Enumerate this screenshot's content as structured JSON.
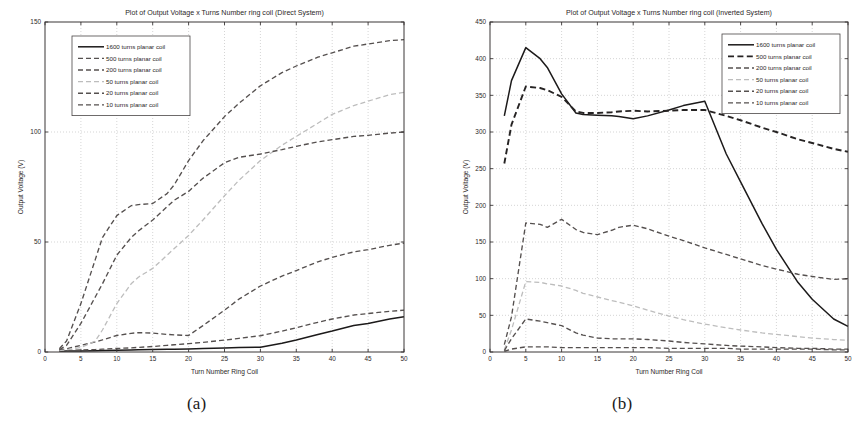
{
  "figure": {
    "caption_a": "(a)",
    "caption_b": "(b)"
  },
  "chart_data": [
    {
      "panel": "a",
      "type": "line",
      "title": "Plot of Output Voltage x Turns Number ring coil (Direct System)",
      "xlabel": "Turn Number Ring Coil",
      "ylabel": "Output Voltage (V)",
      "xlim": [
        0,
        50
      ],
      "ylim": [
        0,
        150
      ],
      "xticks": [
        0,
        5,
        10,
        15,
        20,
        25,
        30,
        35,
        40,
        45,
        50
      ],
      "yticks": [
        0,
        50,
        100,
        150
      ],
      "grid": true,
      "legend_position": "top-left",
      "x": [
        2,
        3,
        5,
        7,
        8,
        10,
        12,
        13,
        15,
        17,
        18,
        20,
        22,
        25,
        27,
        30,
        33,
        35,
        38,
        40,
        43,
        45,
        48,
        50
      ],
      "series": [
        {
          "name": "1600 turns planar coil",
          "style": "solid",
          "values": [
            0.3,
            0.4,
            0.5,
            0.6,
            0.7,
            0.8,
            0.9,
            1.0,
            1.1,
            1.2,
            1.3,
            1.4,
            1.6,
            1.8,
            2.0,
            2.2,
            4.0,
            5.5,
            8.0,
            9.5,
            12.0,
            13.0,
            15.0,
            16.0
          ]
        },
        {
          "name": "500 turns planar coil",
          "style": "dashed",
          "values": [
            0.5,
            0.7,
            0.9,
            1.1,
            1.3,
            1.6,
            1.9,
            2.1,
            2.5,
            3.0,
            3.3,
            3.8,
            4.4,
            5.4,
            6.2,
            7.4,
            9.5,
            11.0,
            13.5,
            15.0,
            16.8,
            17.5,
            18.5,
            19.0
          ]
        },
        {
          "name": "200 turns planar coil",
          "style": "dashed",
          "values": [
            0.8,
            1.5,
            3.0,
            4.6,
            5.5,
            7.5,
            8.5,
            8.8,
            8.6,
            8.0,
            7.8,
            7.5,
            12.0,
            19.0,
            24.0,
            30.0,
            34.5,
            37.0,
            41.0,
            43.0,
            45.5,
            46.5,
            48.5,
            49.5
          ]
        },
        {
          "name": "50 turns planar coil",
          "style": "dashed-light",
          "values": [
            0.6,
            1.0,
            2.0,
            5.0,
            10.0,
            22.0,
            31.0,
            34.0,
            38.0,
            44.0,
            47.0,
            53.0,
            60.0,
            71.0,
            78.0,
            87.0,
            94.0,
            98.0,
            104.0,
            108.0,
            112.0,
            114.0,
            117.0,
            118.0
          ]
        },
        {
          "name": "20 turns planar coil",
          "style": "dashed",
          "values": [
            1.0,
            3.0,
            13.0,
            25.0,
            31.0,
            44.0,
            52.0,
            55.0,
            60.0,
            66.0,
            69.0,
            73.0,
            79.0,
            86.0,
            88.5,
            90.0,
            92.0,
            93.5,
            95.5,
            96.5,
            98.0,
            98.5,
            99.5,
            100.0
          ]
        },
        {
          "name": "10 turns planar coil",
          "style": "dashed",
          "values": [
            1.5,
            5.0,
            22.0,
            42.0,
            52.0,
            62.0,
            66.5,
            67.0,
            67.5,
            72.0,
            76.0,
            87.0,
            96.0,
            107.0,
            113.0,
            121.0,
            127.0,
            130.0,
            134.0,
            136.0,
            139.0,
            140.0,
            141.5,
            142.0
          ]
        }
      ]
    },
    {
      "panel": "b",
      "type": "line",
      "title": "Plot of Output Voltage x Turns Number ring coil (Inverted System)",
      "xlabel": "Turn Number Ring Coil",
      "ylabel": "Output Voltage (V)",
      "xlim": [
        0,
        50
      ],
      "ylim": [
        0,
        450
      ],
      "xticks": [
        0,
        5,
        10,
        15,
        20,
        25,
        30,
        35,
        40,
        45,
        50
      ],
      "yticks": [
        0,
        50,
        100,
        150,
        200,
        250,
        300,
        350,
        400,
        450
      ],
      "grid": true,
      "legend_position": "top-right",
      "x": [
        2,
        3,
        5,
        7,
        8,
        10,
        12,
        13,
        15,
        17,
        18,
        20,
        22,
        25,
        27,
        30,
        33,
        35,
        38,
        40,
        43,
        45,
        48,
        50
      ],
      "series": [
        {
          "name": "1600 turns planar coil",
          "style": "solid",
          "values": [
            322,
            370,
            415,
            400,
            388,
            352,
            326,
            324,
            323,
            322,
            321,
            318,
            322,
            330,
            336,
            342,
            270,
            232,
            175,
            140,
            95,
            72,
            45,
            35
          ]
        },
        {
          "name": "500 turns planar coil",
          "style": "dashed-bold",
          "values": [
            257,
            310,
            362,
            360,
            357,
            348,
            328,
            326,
            326,
            327,
            328,
            329,
            328,
            329,
            330,
            330,
            322,
            316,
            306,
            300,
            290,
            285,
            277,
            273
          ]
        },
        {
          "name": "200 turns planar coil",
          "style": "dashed",
          "values": [
            10,
            48,
            176,
            174,
            170,
            181,
            167,
            163,
            160,
            166,
            170,
            173,
            168,
            158,
            152,
            142,
            133,
            127,
            118,
            113,
            106,
            103,
            99,
            100
          ]
        },
        {
          "name": "50 turns planar coil",
          "style": "dashed-light",
          "values": [
            3,
            30,
            96,
            95,
            93,
            90,
            84,
            80,
            75,
            70,
            68,
            63,
            57,
            49,
            44,
            38,
            33,
            30,
            26,
            24,
            21,
            19,
            17,
            16
          ]
        },
        {
          "name": "20 turns planar coil",
          "style": "dashed",
          "values": [
            2,
            18,
            45,
            42,
            40,
            36,
            26,
            23,
            19,
            18,
            18,
            18,
            17,
            15,
            13,
            11,
            9,
            8,
            7,
            6,
            5,
            5,
            4,
            4
          ]
        },
        {
          "name": "10 turns planar coil",
          "style": "dashed",
          "values": [
            1,
            4,
            7,
            7,
            7,
            6,
            6,
            6,
            6,
            6,
            6,
            6,
            6,
            5,
            5,
            5,
            5,
            4,
            4,
            4,
            4,
            4,
            3,
            3
          ]
        }
      ]
    }
  ]
}
